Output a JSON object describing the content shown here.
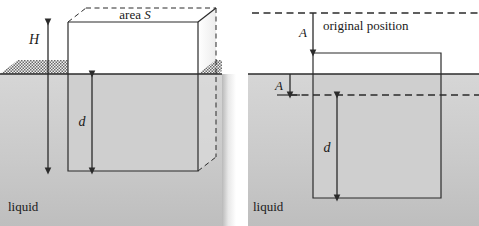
{
  "figure": {
    "colors": {
      "liquid_top": "#d2d2d2",
      "liquid_bottom": "#c2c2c2",
      "line": "#2b2b2b",
      "dashed": "#2b2b2b",
      "hatch": "#6e6e6e",
      "background": "#ffffff",
      "text": "#1a1a1a"
    },
    "panels": [
      {
        "id": "left",
        "name": "equilibrium-panel",
        "liquid_label": "liquid",
        "area_label": "area S",
        "height_label": "H",
        "depth_label": "d",
        "description": "Block partly submerged at equilibrium, drawn in perspective with dashed hidden edges; hatched liquid surface on both sides of the block."
      },
      {
        "id": "right",
        "name": "displaced-panel",
        "liquid_label": "liquid",
        "original_position_label": "original position",
        "displacement_label_top": "A",
        "displacement_label_bottom": "A",
        "depth_label": "d",
        "description": "Block pushed down by amount A from its original position; dashed lines mark the original top and original bottom levels."
      }
    ]
  }
}
